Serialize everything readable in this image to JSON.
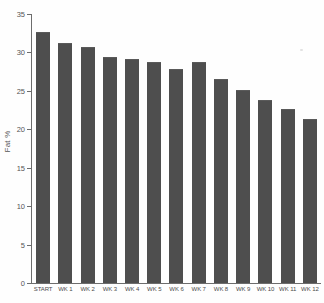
{
  "chart_data": {
    "type": "bar",
    "title": "",
    "xlabel": "",
    "ylabel": "Fat %",
    "categories": [
      "START",
      "WK 1",
      "WK 2",
      "WK 3",
      "WK 4",
      "WK 5",
      "WK 6",
      "WK 7",
      "WK 8",
      "WK 9",
      "WK 10",
      "WK 11",
      "WK 12"
    ],
    "values": [
      32.6,
      31.2,
      30.7,
      29.4,
      29.1,
      28.7,
      27.8,
      28.8,
      26.6,
      25.1,
      23.8,
      22.6,
      21.4
    ],
    "ylim": [
      0,
      35
    ],
    "yticks": [
      0,
      5,
      10,
      15,
      20,
      25,
      30,
      35
    ],
    "ytick_labels": [
      "0",
      "5",
      "10",
      "15",
      "20",
      "25",
      "30",
      "35"
    ],
    "grid": false,
    "legend": false,
    "bar_color": "#4e4e4e",
    "axis_color": "#6d6d6d",
    "background_color": "#fefefe"
  }
}
